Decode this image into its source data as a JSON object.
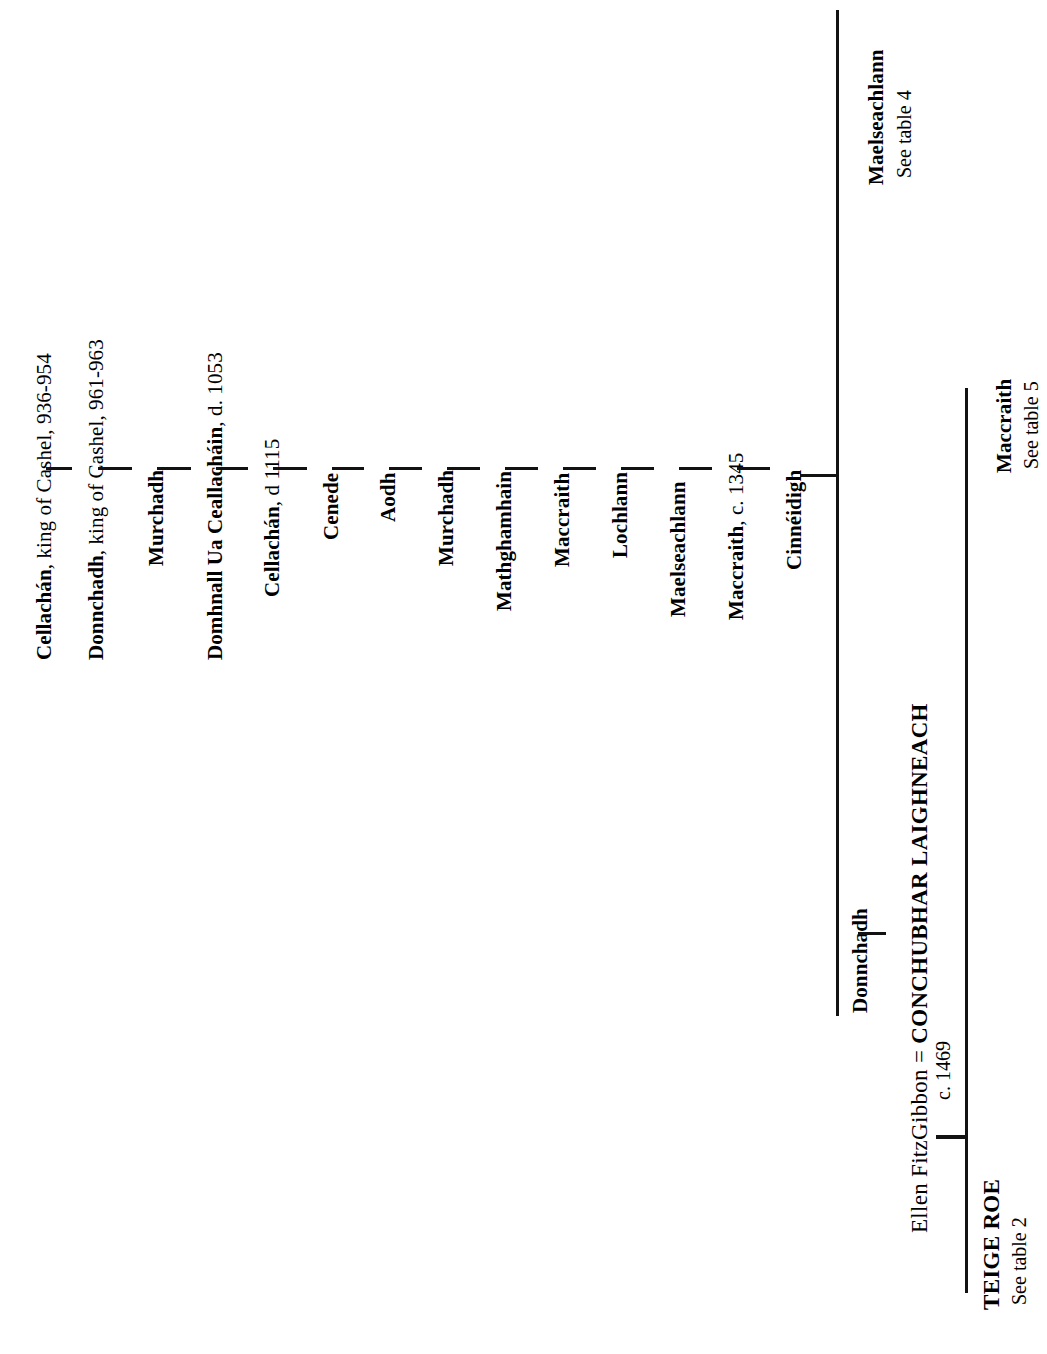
{
  "document": {
    "kind": "genealogical-descent-table",
    "orientation": "rotated-90-ccw"
  },
  "main_line": {
    "label": "main descent chain",
    "people": [
      {
        "name": "Cellachán",
        "annotation": ", king of Cashel, 936-954"
      },
      {
        "name": "Donnchadh",
        "annotation": ", king of Cashel, 961-963"
      },
      {
        "name": "Murchadh",
        "annotation": ""
      },
      {
        "name": "Domhnall Ua Ceallacháin",
        "annotation": ", d. 1053"
      },
      {
        "name": "Cellachán",
        "annotation": ", d 1115"
      },
      {
        "name": "Cenede",
        "annotation": ""
      },
      {
        "name": "Aodh",
        "annotation": ""
      },
      {
        "name": "Murchadh",
        "annotation": ""
      },
      {
        "name": "Mathghamhain",
        "annotation": ""
      },
      {
        "name": "Maccraith",
        "annotation": ""
      },
      {
        "name": "Lochlann",
        "annotation": ""
      },
      {
        "name": "Maelseachlann",
        "annotation": ""
      },
      {
        "name": "Maccraith",
        "annotation": ", c. 1345"
      },
      {
        "name": "Cinnéidigh",
        "annotation": ""
      }
    ]
  },
  "branches": {
    "upper": {
      "name": "Maelseachlann",
      "reference": "See table 4"
    },
    "lower": {
      "name": "Maccraith",
      "reference": "See table 5"
    }
  },
  "descent": {
    "donnchadh": "Donnchadh",
    "conchubhar": {
      "spouse": "Ellen FitzGibbon",
      "equals": "=",
      "name": "CONCHUBHAR LAIGHNEACH",
      "date": "c. 1469"
    },
    "teige": {
      "name": "TEIGE ROE",
      "reference": "See table 2"
    }
  }
}
